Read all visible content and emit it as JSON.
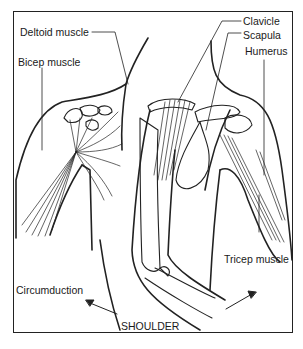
{
  "diagram": {
    "title": "SHOULDER",
    "labels": {
      "deltoid": "Deltoid muscle",
      "bicep": "Bicep muscle",
      "clavicle": "Clavicle",
      "scapula": "Scapula",
      "humerus": "Humerus",
      "tricep": "Tricep muscle",
      "circumduction": "Circumduction"
    },
    "colors": {
      "line": "#222222",
      "background": "#ffffff"
    }
  }
}
